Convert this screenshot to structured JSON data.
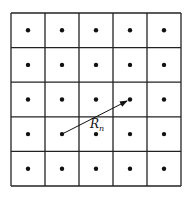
{
  "diagram": {
    "type": "lattice",
    "rows": 5,
    "cols": 5,
    "grid": {
      "x0": 11,
      "y0": 13,
      "x1": 181,
      "y1": 186
    },
    "dot_color": "#111111",
    "line_color": "#222222",
    "vector": {
      "label": "R",
      "subscript": "n",
      "from": {
        "row": 3,
        "col": 1
      },
      "to": {
        "row": 2,
        "col": 3
      }
    }
  }
}
